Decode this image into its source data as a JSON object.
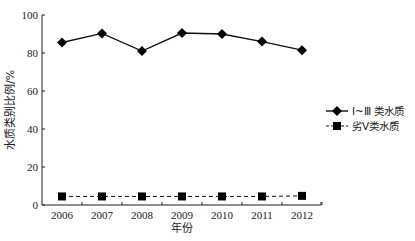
{
  "chart_data": {
    "type": "line",
    "title": "",
    "xlabel": "年份",
    "ylabel": "水质类别比例/%",
    "x": [
      "2006",
      "2007",
      "2008",
      "2009",
      "2010",
      "2011",
      "2012"
    ],
    "ylim": [
      0,
      100
    ],
    "yticks": [
      0,
      20,
      40,
      60,
      80,
      100
    ],
    "grid": false,
    "legend_position": "right",
    "series": [
      {
        "name": "Ⅰ~Ⅲ 类水质",
        "marker": "diamond",
        "line": "solid",
        "color": "#111111",
        "values": [
          85.5,
          90.3,
          81.0,
          90.5,
          90.0,
          86.0,
          81.5
        ]
      },
      {
        "name": "劣Ⅴ类水质",
        "marker": "square",
        "line": "dashed",
        "color": "#111111",
        "values": [
          4.5,
          4.5,
          4.5,
          4.5,
          4.5,
          4.5,
          4.8
        ]
      }
    ]
  }
}
